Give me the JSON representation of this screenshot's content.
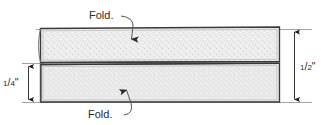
{
  "diagram": {
    "background_color": "#ffffff",
    "line_color": "#3a3a3a",
    "fill_color": "#eeeeee",
    "text_color": "#2b2b2b",
    "callouts": [
      {
        "id": "fold-top",
        "label": "Fold.",
        "arrow_direction": "down",
        "points_to": "upper-panel"
      },
      {
        "id": "fold-bottom",
        "label": "Fold.",
        "arrow_direction": "up",
        "points_to": "lower-panel"
      }
    ],
    "dimensions": [
      {
        "id": "dim-quarter-inch",
        "label": "1/4\"",
        "numerator": "1",
        "denominator": "4",
        "unit": "\"",
        "side": "left",
        "measures": "lower-panel-height"
      },
      {
        "id": "dim-half-inch",
        "label": "1/2\"",
        "numerator": "1",
        "denominator": "2",
        "unit": "\"",
        "side": "right",
        "measures": "total-height"
      }
    ],
    "panels": [
      {
        "id": "upper-panel",
        "name": "upper-folded-panel"
      },
      {
        "id": "lower-panel",
        "name": "lower-folded-panel"
      }
    ]
  }
}
